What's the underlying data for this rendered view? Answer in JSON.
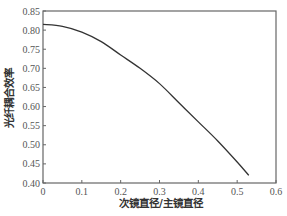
{
  "chart_data": {
    "type": "line",
    "title": "",
    "xlabel": "次镜直径/主镜直径",
    "ylabel": "光纤耦合效率",
    "xlim": [
      0,
      0.6
    ],
    "ylim": [
      0.4,
      0.85
    ],
    "x_ticks": [
      "0",
      "0.1",
      "0.2",
      "0.3",
      "0.4",
      "0.5",
      "0.6"
    ],
    "y_ticks": [
      "0.40",
      "0.45",
      "0.50",
      "0.55",
      "0.60",
      "0.65",
      "0.70",
      "0.75",
      "0.80",
      "0.85"
    ],
    "grid": false,
    "legend": null,
    "series": [
      {
        "name": "coupling-efficiency",
        "color": "#333333",
        "x": [
          0,
          0.05,
          0.1,
          0.15,
          0.2,
          0.25,
          0.3,
          0.35,
          0.4,
          0.45,
          0.5,
          0.53
        ],
        "y": [
          0.815,
          0.81,
          0.795,
          0.77,
          0.735,
          0.7,
          0.66,
          0.61,
          0.56,
          0.51,
          0.455,
          0.42
        ]
      }
    ]
  }
}
